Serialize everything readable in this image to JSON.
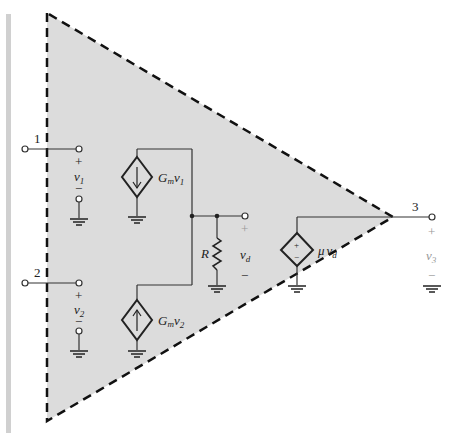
{
  "diagram": {
    "colors": {
      "fill": "#dcdcdc",
      "line": "#333333",
      "dash": "#111111",
      "side_bar": "#d0d0d0"
    },
    "nodes": [
      {
        "id": "1",
        "label": "1"
      },
      {
        "id": "2",
        "label": "2"
      },
      {
        "id": "3",
        "label": "3"
      }
    ],
    "labels": {
      "v1_plus": "+",
      "v1": "v",
      "v1_sub": "1",
      "v1_minus": "−",
      "v2_plus": "+",
      "v2": "v",
      "v2_sub": "2",
      "v2_minus": "−",
      "gm1_G": "G",
      "gm1_m": "m",
      "gm1_v": "v",
      "gm1_sub": "1",
      "gm2_G": "G",
      "gm2_m": "m",
      "gm2_v": "v",
      "gm2_sub": "2",
      "R": "R",
      "vd_plus": "+",
      "vd": "v",
      "vd_sub": "d",
      "vd_minus": "−",
      "mu": "μ",
      "mu_v": "v",
      "mu_sub": "d",
      "src_plus": "+",
      "src_minus": "−",
      "v3_plus": "+",
      "v3": "v",
      "v3_sub": "3",
      "v3_minus": "−"
    },
    "components": [
      {
        "type": "dependent-current-source",
        "direction": "down",
        "value": "G_m v_1"
      },
      {
        "type": "dependent-current-source",
        "direction": "up",
        "value": "G_m v_2"
      },
      {
        "type": "resistor",
        "value": "R"
      },
      {
        "type": "dependent-voltage-source",
        "value": "μ v_d"
      }
    ]
  }
}
